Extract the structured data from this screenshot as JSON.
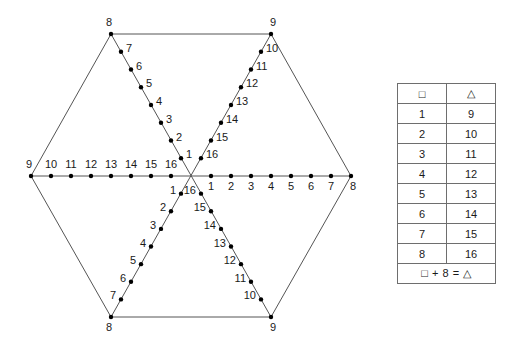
{
  "figure": {
    "type": "hexagon-number-line-diagram",
    "center": {
      "x": 191,
      "y": 176
    },
    "vertices": [
      {
        "name": "top-left",
        "x": 111,
        "y": 34,
        "label": "8"
      },
      {
        "name": "top-right",
        "x": 271,
        "y": 34,
        "label": "9"
      },
      {
        "name": "right",
        "x": 351,
        "y": 176,
        "label": "8"
      },
      {
        "name": "bottom-right",
        "x": 271,
        "y": 317,
        "label": "9"
      },
      {
        "name": "bottom-left",
        "x": 111,
        "y": 317,
        "label": "8"
      },
      {
        "name": "left",
        "x": 31,
        "y": 176,
        "label": "9"
      }
    ],
    "arms": [
      {
        "name": "arm-left-horizontal",
        "from": "center",
        "to": "left",
        "label_side": "above",
        "labels": [
          "16",
          "15",
          "14",
          "13",
          "12",
          "11",
          "10",
          "9"
        ]
      },
      {
        "name": "arm-right-horizontal",
        "from": "center",
        "to": "right",
        "label_side": "below",
        "labels": [
          "1",
          "2",
          "3",
          "4",
          "5",
          "6",
          "7",
          "8"
        ]
      },
      {
        "name": "arm-upper-left",
        "from": "center",
        "to": "top-left",
        "label_side": "right",
        "labels": [
          "1",
          "2",
          "3",
          "4",
          "5",
          "6",
          "7",
          "8"
        ]
      },
      {
        "name": "arm-upper-right",
        "from": "center",
        "to": "top-right",
        "label_side": "right",
        "labels": [
          "16",
          "15",
          "14",
          "13",
          "12",
          "11",
          "10",
          "9"
        ]
      },
      {
        "name": "arm-lower-left",
        "from": "center",
        "to": "bottom-left",
        "label_side": "left",
        "labels": [
          "1",
          "2",
          "3",
          "4",
          "5",
          "6",
          "7",
          "8"
        ]
      },
      {
        "name": "arm-lower-right",
        "from": "center",
        "to": "bottom-right",
        "label_side": "left",
        "labels": [
          "16",
          "15",
          "14",
          "13",
          "12",
          "11",
          "10",
          "9"
        ]
      }
    ],
    "colors": {
      "line": "#555555",
      "dot": "#000000",
      "text": "#1a1a1a",
      "background": "#ffffff",
      "table_border": "#6e6e6e"
    }
  },
  "table": {
    "name": "square-triangle-correspondence-table",
    "headers": [
      "□",
      "△"
    ],
    "rows": [
      [
        "1",
        "9"
      ],
      [
        "2",
        "10"
      ],
      [
        "3",
        "11"
      ],
      [
        "4",
        "12"
      ],
      [
        "5",
        "13"
      ],
      [
        "6",
        "14"
      ],
      [
        "7",
        "15"
      ],
      [
        "8",
        "16"
      ]
    ],
    "footer": "□ + 8 = △"
  }
}
